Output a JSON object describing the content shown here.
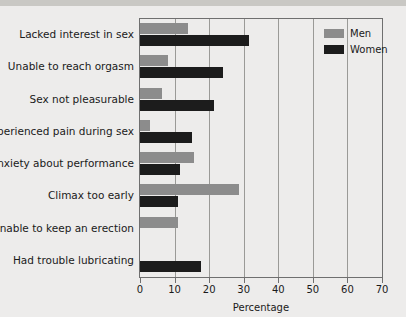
{
  "chart_data": {
    "type": "bar",
    "orientation": "horizontal",
    "title": "",
    "xlabel": "Percentage",
    "ylabel": "",
    "xlim": [
      0,
      70
    ],
    "xticks": [
      0,
      10,
      20,
      30,
      40,
      50,
      60,
      70
    ],
    "grid": true,
    "legend_position": "top-right",
    "categories": [
      "Lacked interest in sex",
      "Unable to reach orgasm",
      "Sex not pleasurable",
      "Experienced pain during sex",
      "Anxiety about performance",
      "Climax too early",
      "Unable to keep an erection",
      "Had trouble lubricating"
    ],
    "series": [
      {
        "name": "Men",
        "color": "#8c8c8c",
        "values": [
          14,
          8,
          6.5,
          3,
          15.5,
          28.5,
          11,
          null
        ]
      },
      {
        "name": "Women",
        "color": "#1c1c1c",
        "values": [
          31.5,
          24,
          21.5,
          15,
          11.5,
          11,
          null,
          17.5
        ]
      }
    ]
  },
  "legend": {
    "items": [
      {
        "label": "Men",
        "color": "#8c8c8c"
      },
      {
        "label": "Women",
        "color": "#1c1c1c"
      }
    ]
  },
  "axis": {
    "x_title": "Percentage"
  }
}
